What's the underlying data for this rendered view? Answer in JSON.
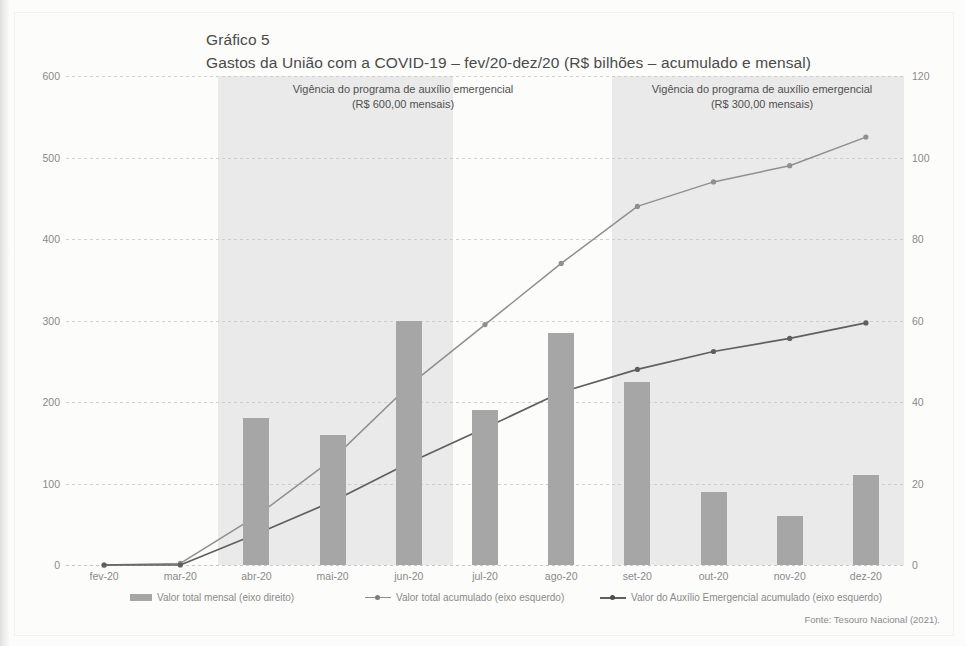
{
  "figure": {
    "label": "Gráfico 5",
    "title": "Gastos da União com a COVID-19 – fev/20-dez/20 (R$ bilhões – acumulado e mensal)",
    "source": "Fonte: Tesouro Nacional (2021)."
  },
  "annotations": [
    {
      "line1": "Vigência do programa de auxílio emergencial",
      "line2": "(R$ 600,00 mensais)"
    },
    {
      "line1": "Vigência do programa de auxílio emergencial",
      "line2": "(R$ 300,00 mensais)"
    }
  ],
  "legend": [
    {
      "label": "Valor total mensal (eixo direito)",
      "marker": "bar-swatch",
      "color": "#a6a6a6"
    },
    {
      "label": "Valor total acumulado (eixo esquerdo)",
      "marker": "line-marker",
      "color": "#8f8f8f"
    },
    {
      "label": "Valor do Auxílio Emergencial acumulado (eixo esquerdo)",
      "marker": "line-marker-dark",
      "color": "#5f5f5f"
    }
  ],
  "chart_data": {
    "type": "bar",
    "title": "Gastos da União com a COVID-19 – fev/20-dez/20 (R$ bilhões – acumulado e mensal)",
    "xlabel": "",
    "ylabel": "",
    "categories": [
      "fev-20",
      "mar-20",
      "abr-20",
      "mai-20",
      "jun-20",
      "jul-20",
      "ago-20",
      "set-20",
      "out-20",
      "nov-20",
      "dez-20"
    ],
    "yticks_left": [
      0,
      100,
      200,
      300,
      400,
      500,
      600
    ],
    "yticks_right": [
      0,
      20,
      40,
      60,
      80,
      100,
      120
    ],
    "ylim_left": [
      0,
      600
    ],
    "ylim_right": [
      0,
      120
    ],
    "grid": true,
    "legend_position": "bottom",
    "series": [
      {
        "name": "Valor total mensal (eixo direito)",
        "type": "bar",
        "axis": "right",
        "color": "#a6a6a6",
        "values": [
          0,
          0,
          36,
          32,
          60,
          38,
          57,
          45,
          18,
          12,
          22
        ]
      },
      {
        "name": "Valor total acumulado (eixo esquerdo)",
        "type": "line",
        "axis": "left",
        "color": "#8f8f8f",
        "values": [
          0,
          2,
          60,
          130,
          220,
          295,
          370,
          440,
          470,
          490,
          525
        ]
      },
      {
        "name": "Valor do Auxílio Emergencial acumulado (eixo esquerdo)",
        "type": "line",
        "axis": "left",
        "color": "#5f5f5f",
        "values": [
          0,
          0,
          38,
          78,
          125,
          168,
          212,
          240,
          262,
          278,
          297
        ]
      }
    ],
    "shaded_regions": [
      {
        "label": "Vigência do programa de auxílio emergencial (R$ 600,00 mensais)",
        "from": "abr-20",
        "to": "ago-20",
        "color": "#e3e3e3"
      },
      {
        "label": "Vigência do programa de auxílio emergencial (R$ 300,00 mensais)",
        "from": "set-20",
        "to": "dez-20",
        "color": "#e3e3e3"
      }
    ]
  }
}
